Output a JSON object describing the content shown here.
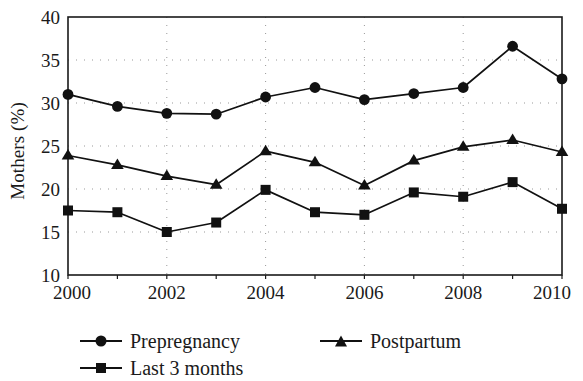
{
  "chart_data": {
    "type": "line",
    "title": "",
    "xlabel": "",
    "ylabel": "Mothers (%)",
    "xlim": [
      2000,
      2010
    ],
    "ylim": [
      10,
      40
    ],
    "grid": true,
    "legend_position": "bottom",
    "x": [
      2000,
      2001,
      2002,
      2003,
      2004,
      2005,
      2006,
      2007,
      2008,
      2009,
      2010
    ],
    "xticks": [
      2000,
      2002,
      2004,
      2006,
      2008,
      2010
    ],
    "xtick_labels": [
      "2000",
      "2002",
      "2004",
      "2006",
      "2008",
      "2010"
    ],
    "yticks": [
      10,
      15,
      20,
      25,
      30,
      35,
      40
    ],
    "ytick_labels": [
      "10",
      "15",
      "20",
      "25",
      "30",
      "35",
      "40"
    ],
    "series": [
      {
        "name": "Prepregnancy",
        "marker": "circle",
        "color": "#111111",
        "values": [
          31.0,
          29.6,
          28.8,
          28.7,
          30.7,
          31.8,
          30.4,
          31.1,
          31.8,
          36.6,
          32.8
        ]
      },
      {
        "name": "Last 3 months",
        "marker": "square",
        "color": "#111111",
        "values": [
          17.5,
          17.3,
          15.0,
          16.1,
          19.9,
          17.3,
          17.0,
          19.6,
          19.1,
          20.8,
          17.7
        ]
      },
      {
        "name": "Postpartum",
        "marker": "triangle",
        "color": "#111111",
        "values": [
          23.9,
          22.8,
          21.5,
          20.5,
          24.4,
          23.1,
          20.4,
          23.3,
          24.9,
          25.7,
          24.3
        ]
      }
    ]
  },
  "legend": {
    "entries": [
      {
        "label": "Prepregnancy",
        "marker": "circle"
      },
      {
        "label": "Last 3 months",
        "marker": "square"
      },
      {
        "label": "Postpartum",
        "marker": "triangle"
      }
    ]
  },
  "axes": {
    "y_title": "Mothers (%)"
  },
  "style": {
    "line_color": "#111111",
    "grid_color": "#999999",
    "frame_color": "#1a1a1a",
    "background": "#ffffff"
  }
}
